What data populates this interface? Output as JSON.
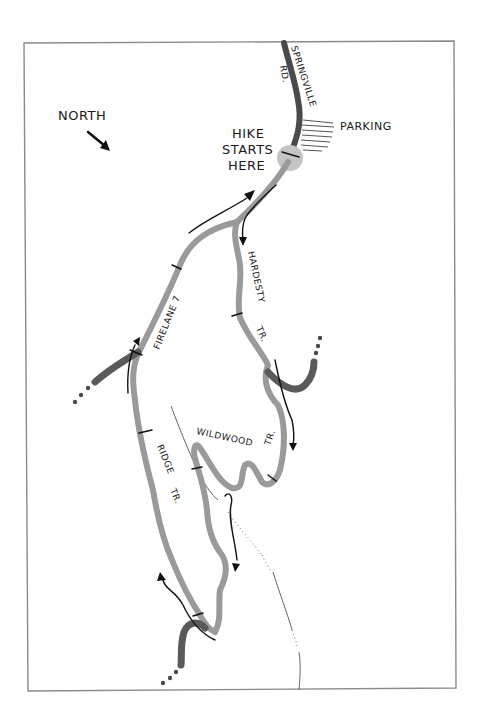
{
  "map": {
    "compass": {
      "label": "NORTH",
      "icon": "north-arrow-icon"
    },
    "start_marker": {
      "line1": "HIKE",
      "line2": "STARTS",
      "line3": "HERE",
      "icon": "trailhead-circle-icon"
    },
    "parking": {
      "label": "PARKING",
      "icon": "parking-hatch-icon"
    },
    "roads": [
      {
        "name": "SPRINGVILLE",
        "suffix": "RD."
      }
    ],
    "trails": [
      {
        "name": "FIRELANE 7"
      },
      {
        "name": "HARDESTY",
        "suffix": "TR."
      },
      {
        "name": "WILDWOOD",
        "suffix": "TR."
      },
      {
        "name": "RIDGE",
        "suffix": "TR."
      }
    ],
    "colors": {
      "trail": "#9a9a9a",
      "road": "#4a4a4a",
      "frame": "#8a8a8a",
      "ink": "#111111",
      "background": "#ffffff"
    }
  }
}
